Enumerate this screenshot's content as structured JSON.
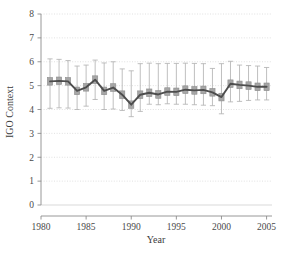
{
  "chart_data": {
    "type": "line",
    "title": "",
    "xlabel": "Year",
    "ylabel": "IGO Context",
    "xlim": [
      1980,
      2005.6
    ],
    "ylim": [
      0,
      8
    ],
    "xticks": [
      1980,
      1985,
      1990,
      1995,
      2000,
      2005
    ],
    "xticklabels": [
      "1980",
      "1985",
      "1990",
      "1995",
      "2000",
      "2005"
    ],
    "yticks": [
      0,
      1,
      2,
      3,
      4,
      5,
      6,
      7,
      8
    ],
    "yticklabels": [
      "0",
      "1",
      "2",
      "3",
      "4",
      "5",
      "6",
      "7",
      "8"
    ],
    "grid": true,
    "grid_axis": "y",
    "legend": "none",
    "x": [
      1981,
      1982,
      1983,
      1984,
      1985,
      1986,
      1987,
      1988,
      1989,
      1990,
      1991,
      1992,
      1993,
      1994,
      1995,
      1996,
      1997,
      1998,
      1999,
      2000,
      2001,
      2002,
      2003,
      2004,
      2005
    ],
    "series": [
      {
        "name": "IGO Context mean",
        "values": [
          5.18,
          5.2,
          5.18,
          4.78,
          4.93,
          5.25,
          4.78,
          4.92,
          4.62,
          4.2,
          4.62,
          4.7,
          4.63,
          4.75,
          4.74,
          4.83,
          4.8,
          4.82,
          4.72,
          4.52,
          5.08,
          5.03,
          5.0,
          4.95,
          4.95
        ]
      }
    ],
    "boxes": [
      {
        "year": 1981,
        "low": 4.05,
        "q1": 5.02,
        "median": 5.18,
        "q3": 5.34,
        "high": 6.12
      },
      {
        "year": 1982,
        "low": 4.07,
        "q1": 5.05,
        "median": 5.2,
        "q3": 5.36,
        "high": 6.1
      },
      {
        "year": 1983,
        "low": 4.06,
        "q1": 5.02,
        "median": 5.18,
        "q3": 5.34,
        "high": 6.05
      },
      {
        "year": 1984,
        "low": 4.0,
        "q1": 4.62,
        "median": 4.78,
        "q3": 4.94,
        "high": 5.82
      },
      {
        "year": 1985,
        "low": 4.14,
        "q1": 4.77,
        "median": 4.93,
        "q3": 5.09,
        "high": 5.86
      },
      {
        "year": 1986,
        "low": 4.42,
        "q1": 5.09,
        "median": 5.25,
        "q3": 5.41,
        "high": 6.07
      },
      {
        "year": 1987,
        "low": 4.0,
        "q1": 4.62,
        "median": 4.78,
        "q3": 4.94,
        "high": 5.95
      },
      {
        "year": 1988,
        "low": 4.02,
        "q1": 4.76,
        "median": 4.92,
        "q3": 5.08,
        "high": 6.0
      },
      {
        "year": 1989,
        "low": 3.96,
        "q1": 4.46,
        "median": 4.62,
        "q3": 4.78,
        "high": 5.7
      },
      {
        "year": 1990,
        "low": 3.7,
        "q1": 4.05,
        "median": 4.2,
        "q3": 4.36,
        "high": 5.62
      },
      {
        "year": 1991,
        "low": 3.92,
        "q1": 4.46,
        "median": 4.62,
        "q3": 4.78,
        "high": 5.92
      },
      {
        "year": 1992,
        "low": 4.22,
        "q1": 4.54,
        "median": 4.7,
        "q3": 4.86,
        "high": 5.94
      },
      {
        "year": 1993,
        "low": 4.2,
        "q1": 4.47,
        "median": 4.63,
        "q3": 4.79,
        "high": 5.92
      },
      {
        "year": 1994,
        "low": 4.24,
        "q1": 4.59,
        "median": 4.75,
        "q3": 4.91,
        "high": 5.93
      },
      {
        "year": 1995,
        "low": 4.22,
        "q1": 4.58,
        "median": 4.74,
        "q3": 4.9,
        "high": 5.93
      },
      {
        "year": 1996,
        "low": 4.22,
        "q1": 4.67,
        "median": 4.83,
        "q3": 4.99,
        "high": 5.94
      },
      {
        "year": 1997,
        "low": 4.2,
        "q1": 4.64,
        "median": 4.8,
        "q3": 4.96,
        "high": 5.93
      },
      {
        "year": 1998,
        "low": 4.18,
        "q1": 4.66,
        "median": 4.82,
        "q3": 4.98,
        "high": 5.92
      },
      {
        "year": 1999,
        "low": 4.16,
        "q1": 4.56,
        "median": 4.72,
        "q3": 4.88,
        "high": 5.72
      },
      {
        "year": 2000,
        "low": 3.82,
        "q1": 4.36,
        "median": 4.52,
        "q3": 4.68,
        "high": 5.92
      },
      {
        "year": 2001,
        "low": 4.32,
        "q1": 4.92,
        "median": 5.08,
        "q3": 5.24,
        "high": 6.02
      },
      {
        "year": 2002,
        "low": 4.34,
        "q1": 4.87,
        "median": 5.03,
        "q3": 5.19,
        "high": 5.86
      },
      {
        "year": 2003,
        "low": 4.38,
        "q1": 4.84,
        "median": 5.0,
        "q3": 5.16,
        "high": 5.84
      },
      {
        "year": 2004,
        "low": 4.4,
        "q1": 4.79,
        "median": 4.95,
        "q3": 5.11,
        "high": 5.82
      },
      {
        "year": 2005,
        "low": 4.4,
        "q1": 4.79,
        "median": 4.95,
        "q3": 5.11,
        "high": 5.76
      }
    ],
    "colors": {
      "line": "#4d4d4d",
      "box_fill": "#a6a6a6",
      "box_edge": "#8c8c8c",
      "whisker": "#b3b3b3",
      "grid": "#d9d9d9",
      "axis": "#8c8c8c",
      "text": "#3f3f3f",
      "background": "#ffffff"
    }
  }
}
